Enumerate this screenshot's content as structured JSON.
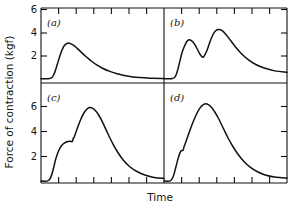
{
  "figure": {
    "ylabel": "Force of contraction (kgf)",
    "xlabel": "Time",
    "line_color": "#111111",
    "axis_color": "#111111",
    "background": "#ffffff"
  },
  "panels": {
    "a": {
      "label": "(a)"
    },
    "b": {
      "label": "(b)"
    },
    "c": {
      "label": "(c)"
    },
    "d": {
      "label": "(d)"
    }
  },
  "yticks": {
    "top": [
      "6",
      "4",
      "2"
    ],
    "bottom": [
      "6",
      "4",
      "2"
    ]
  },
  "chart_data": [
    {
      "type": "line",
      "panel": "(a)",
      "title": "Single twitch",
      "xlabel": "Time",
      "ylabel": "Force of contraction (kgf)",
      "xlim": [
        0,
        10
      ],
      "ylim": [
        0,
        7
      ],
      "yticks": [
        2,
        4,
        6
      ],
      "ytick_labels": [
        "2",
        "4",
        "6"
      ],
      "xticks_unlabeled": 7,
      "grid": false,
      "legend": false,
      "peak_value": 3.1,
      "x": [
        0.0,
        0.6,
        0.9,
        1.1,
        1.3,
        1.5,
        1.7,
        1.9,
        2.1,
        2.3,
        2.6,
        2.9,
        3.2,
        3.6,
        4.0,
        4.5,
        5.0,
        5.6,
        6.2,
        7.0,
        8.0,
        9.0,
        10.0
      ],
      "y": [
        0.05,
        0.05,
        0.15,
        0.55,
        1.2,
        1.9,
        2.5,
        2.9,
        3.08,
        3.1,
        2.95,
        2.7,
        2.4,
        2.0,
        1.65,
        1.25,
        0.95,
        0.68,
        0.48,
        0.28,
        0.14,
        0.08,
        0.06
      ]
    },
    {
      "type": "line",
      "panel": "(b)",
      "title": "Summation of two twitches",
      "xlabel": "Time",
      "ylabel": "Force of contraction (kgf)",
      "xlim": [
        0,
        10
      ],
      "ylim": [
        0,
        7
      ],
      "yticks": [
        2,
        4,
        6
      ],
      "ytick_labels": [
        "2",
        "4",
        "6"
      ],
      "xticks_unlabeled": 7,
      "grid": false,
      "legend": false,
      "first_peak_value": 3.4,
      "trough_value": 1.9,
      "second_peak_value": 4.3,
      "x": [
        0.0,
        0.6,
        0.9,
        1.1,
        1.3,
        1.5,
        1.8,
        2.0,
        2.2,
        2.5,
        2.8,
        3.0,
        3.2,
        3.5,
        3.8,
        4.1,
        4.4,
        4.7,
        5.0,
        5.4,
        5.8,
        6.3,
        6.9,
        7.5,
        8.2,
        9.0,
        10.0
      ],
      "y": [
        0.05,
        0.05,
        0.2,
        0.75,
        1.6,
        2.4,
        3.15,
        3.38,
        3.35,
        3.0,
        2.4,
        2.05,
        1.92,
        2.5,
        3.4,
        4.05,
        4.28,
        4.2,
        3.9,
        3.35,
        2.8,
        2.2,
        1.65,
        1.25,
        0.95,
        0.72,
        0.6
      ]
    },
    {
      "type": "line",
      "panel": "(c)",
      "title": "Unfused tetanus",
      "xlabel": "Time",
      "ylabel": "Force of contraction (kgf)",
      "xlim": [
        0,
        10
      ],
      "ylim": [
        0,
        7
      ],
      "yticks": [
        2,
        4,
        6
      ],
      "ytick_labels": [
        "2",
        "4",
        "6"
      ],
      "xticks_unlabeled": 7,
      "grid": false,
      "legend": false,
      "shoulder_value": 3.25,
      "peak_value": 5.9,
      "x": [
        0.0,
        0.55,
        0.8,
        1.0,
        1.2,
        1.45,
        1.7,
        1.95,
        2.2,
        2.4,
        2.55,
        2.62,
        2.7,
        2.9,
        3.2,
        3.5,
        3.8,
        4.1,
        4.4,
        4.7,
        5.0,
        5.4,
        5.8,
        6.2,
        6.7,
        7.2,
        7.8,
        8.5,
        9.2,
        10.0
      ],
      "y": [
        0.05,
        0.05,
        0.35,
        1.0,
        1.8,
        2.5,
        2.9,
        3.1,
        3.2,
        3.22,
        3.2,
        3.45,
        3.55,
        4.1,
        4.9,
        5.5,
        5.85,
        5.9,
        5.7,
        5.3,
        4.75,
        3.9,
        3.1,
        2.4,
        1.7,
        1.2,
        0.8,
        0.5,
        0.32,
        0.25
      ]
    },
    {
      "type": "line",
      "panel": "(d)",
      "title": "Fused tetanus",
      "xlabel": "Time",
      "ylabel": "Force of contraction (kgf)",
      "xlim": [
        0,
        10
      ],
      "ylim": [
        0,
        7
      ],
      "yticks": [
        2,
        4,
        6
      ],
      "ytick_labels": [
        "2",
        "4",
        "6"
      ],
      "xticks_unlabeled": 7,
      "grid": false,
      "legend": false,
      "step_value": 2.55,
      "peak_value": 6.2,
      "x": [
        0.0,
        0.5,
        0.75,
        0.95,
        1.15,
        1.35,
        1.55,
        1.62,
        1.75,
        2.0,
        2.3,
        2.6,
        2.9,
        3.2,
        3.5,
        3.8,
        4.1,
        4.4,
        4.8,
        5.2,
        5.6,
        6.0,
        6.5,
        7.0,
        7.6,
        8.3,
        9.1,
        10.0
      ],
      "y": [
        0.05,
        0.05,
        0.4,
        1.1,
        1.85,
        2.4,
        2.5,
        2.75,
        3.1,
        3.8,
        4.6,
        5.3,
        5.85,
        6.15,
        6.2,
        6.0,
        5.6,
        5.1,
        4.3,
        3.5,
        2.8,
        2.2,
        1.6,
        1.15,
        0.78,
        0.5,
        0.34,
        0.28
      ]
    }
  ]
}
